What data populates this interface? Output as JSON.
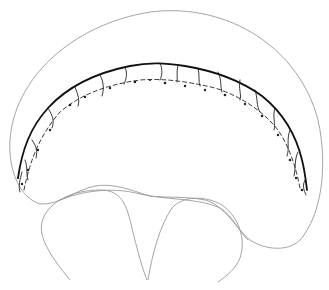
{
  "figure": {
    "type": "scientific-line-illustration",
    "colors": {
      "background": "#ffffff",
      "outline": "#9a9a9a",
      "vein_band": "#111111"
    }
  }
}
